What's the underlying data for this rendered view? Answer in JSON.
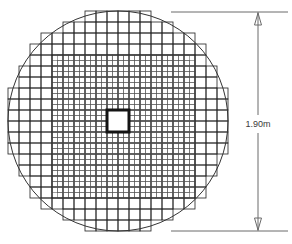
{
  "figure": {
    "name": "circular-domain-structured-mesh",
    "background_color": "#ffffff",
    "line_color": "#2b2b2b",
    "fine_line_color": "#555555",
    "circle_color": "#333333"
  },
  "geometry": {
    "circle": {
      "label": "outer-circular-boundary",
      "center_x": 118,
      "center_y": 121,
      "radius": 110
    },
    "coarse_grid": {
      "label": "outer-coarse-mesh",
      "cell_size": 11.0,
      "origin_x": 8,
      "origin_y": 11,
      "columns": 20,
      "rows": 20
    },
    "fine_grid": {
      "label": "inner-refined-mesh",
      "cell_size": 5.5,
      "x0": 52,
      "y0": 55,
      "x1": 195,
      "y1": 198,
      "corner_cut": 11
    },
    "center_square": {
      "label": "central-square-hole",
      "x": 107,
      "y": 110,
      "size": 22,
      "stroke_width": 3,
      "fill": "#ffffff"
    }
  },
  "dimension": {
    "label": "overall-diameter",
    "value_text": "1.90m",
    "value": 1.9,
    "unit": "m",
    "orientation": "vertical",
    "line_x": 258,
    "top_y": 12,
    "bottom_y": 231,
    "arrow_size": 6,
    "text_x": 258,
    "text_y": 124,
    "extension_top": {
      "x1": 171,
      "y1": 12,
      "x2": 288,
      "y2": 12
    },
    "extension_bottom": {
      "x1": 171,
      "y1": 231,
      "x2": 288,
      "y2": 231
    }
  },
  "chart_data": {
    "type": "diagram",
    "annotations": [
      {
        "text": "1.90m",
        "role": "diameter-dimension",
        "x": 258,
        "y": 124
      }
    ],
    "elements": [
      {
        "name": "outer circle",
        "kind": "circle",
        "diameter_m": 1.9
      },
      {
        "name": "coarse block mesh",
        "kind": "grid",
        "relative_cell": 1.0
      },
      {
        "name": "refined block mesh",
        "kind": "grid",
        "relative_cell": 0.5
      },
      {
        "name": "central square hole",
        "kind": "square"
      }
    ]
  }
}
